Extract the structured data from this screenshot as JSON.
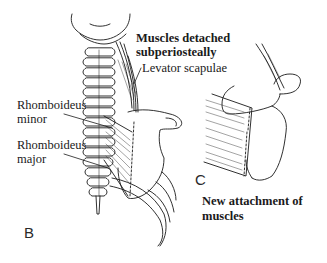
{
  "figure": {
    "panels": [
      {
        "id": "B",
        "label": "B",
        "description": "Posterior view of neck and upper back: cervical/thoracic spine, scapula, ribs",
        "annotations": {
          "muscles_detached_line1": "Muscles detached",
          "muscles_detached_line2": "subperiosteally",
          "levator": "Levator scapulae",
          "rhomboid_minor_line1": "Rhomboideus",
          "rhomboid_minor_line2": "minor",
          "rhomboid_major_line1": "Rhomboideus",
          "rhomboid_major_line2": "major"
        }
      },
      {
        "id": "C",
        "label": "C",
        "description": "Scapula with muscles reattached",
        "annotations": {
          "new_attachment_line1": "New attachment of",
          "new_attachment_line2": "muscles"
        }
      }
    ],
    "colors": {
      "ink": "#1a1a1a",
      "background": "#ffffff"
    }
  }
}
